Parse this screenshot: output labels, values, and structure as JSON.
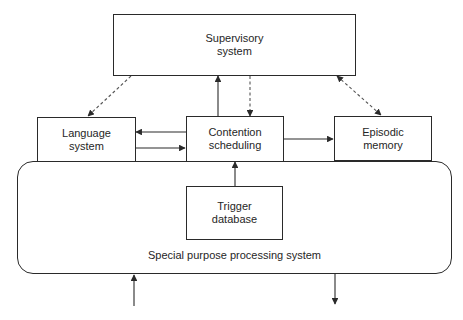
{
  "diagram": {
    "title": "",
    "colors": {
      "line": "#2a2a2a",
      "text": "#262626",
      "background": "#ffffff"
    },
    "nodes": {
      "supervisory": {
        "line1": "Supervisory",
        "line2": "system"
      },
      "language": {
        "line1": "Language",
        "line2": "system"
      },
      "contention": {
        "line1": "Contention",
        "line2": "scheduling"
      },
      "episodic": {
        "line1": "Episodic",
        "line2": "memory"
      },
      "trigger": {
        "line1": "Trigger",
        "line2": "database"
      },
      "special_purpose": {
        "label": "Special purpose processing system"
      }
    },
    "edges": [
      {
        "from": "supervisory",
        "to": "language",
        "style": "dashed",
        "direction": "forward"
      },
      {
        "from": "contention",
        "to": "supervisory",
        "style": "solid",
        "direction": "forward"
      },
      {
        "from": "supervisory",
        "to": "contention",
        "style": "dashed",
        "direction": "forward"
      },
      {
        "from": "supervisory",
        "to": "episodic",
        "style": "dashed",
        "direction": "both"
      },
      {
        "from": "contention",
        "to": "language",
        "style": "solid",
        "direction": "forward"
      },
      {
        "from": "language",
        "to": "contention",
        "style": "solid",
        "direction": "forward"
      },
      {
        "from": "contention",
        "to": "episodic",
        "style": "solid",
        "direction": "forward"
      },
      {
        "from": "trigger",
        "to": "contention",
        "style": "solid",
        "direction": "forward"
      },
      {
        "from": "external-input",
        "to": "special_purpose",
        "style": "solid",
        "direction": "forward"
      },
      {
        "from": "special_purpose",
        "to": "external-output",
        "style": "solid",
        "direction": "forward"
      }
    ]
  }
}
